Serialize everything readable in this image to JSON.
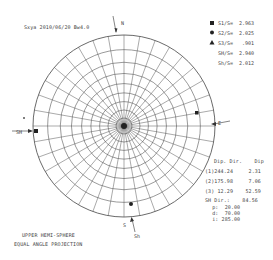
{
  "header": {
    "title": "Sxya 2010/06/20 Bw4.0"
  },
  "net": {
    "center_x": 124,
    "center_y": 126,
    "radius": 91,
    "north_label": "N",
    "south_label": "S",
    "east_label": "E",
    "west_label": "SH",
    "bottom_arrow_label": "Sh",
    "grid_color": "#555555"
  },
  "legend": {
    "items": [
      {
        "symbol": "square",
        "label": "S1/S=  2.963"
      },
      {
        "symbol": "circle",
        "label": "S2/S=  2.025"
      },
      {
        "symbol": "triangle",
        "label": "S3/S=   .901"
      },
      {
        "symbol": "none",
        "label": "SH/S=  2.940"
      },
      {
        "symbol": "none",
        "label": "Sh/S=  2.012"
      }
    ]
  },
  "table": {
    "header": "Dip. Dir.    Dip",
    "rows": [
      "(1)244.24     2.31",
      "(2)175.98     7.06",
      "(3) 12.29    52.59"
    ],
    "sh_dir": "SH Dir.:    84.56",
    "params": [
      "  p:  20.00",
      "  d:  70.00",
      "  i: 285.00"
    ]
  },
  "footer": {
    "line1": "UPPER HEMI-SPHERE",
    "line2": "EQUAL ANGLE PROJECTION"
  }
}
